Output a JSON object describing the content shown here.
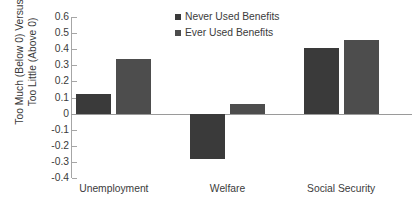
{
  "chart_data": {
    "type": "bar",
    "title": "",
    "xlabel": "",
    "ylabel_line1": "Too Much (Below 0) Versus",
    "ylabel_line2": "Too Little (Above 0)",
    "categories": [
      "Unemployment",
      "Welfare",
      "Social Security"
    ],
    "series": [
      {
        "name": "Never Used Benefits",
        "color": "#3a3a3a",
        "values": [
          0.12,
          -0.28,
          0.41
        ]
      },
      {
        "name": "Ever Used Benefits",
        "color": "#4d4d4d",
        "values": [
          0.34,
          0.06,
          0.46
        ]
      }
    ],
    "ylim": [
      -0.4,
      0.6
    ],
    "yticks": [
      0.6,
      0.5,
      0.4,
      0.3,
      0.2,
      0.1,
      0,
      -0.1,
      -0.2,
      -0.3,
      -0.4
    ],
    "ytick_labels": [
      "0.6",
      "0.5",
      "0.4",
      "0.3",
      "0.2",
      "0.1",
      "0",
      "-0.1",
      "-0.2",
      "-0.3",
      "-0.4"
    ],
    "grid": false,
    "legend_position": "top-center",
    "zero_line": true
  }
}
